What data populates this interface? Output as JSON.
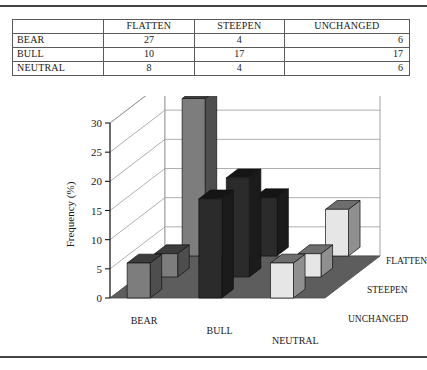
{
  "page": {
    "has_top_rule": true,
    "has_bottom_rule": true
  },
  "table": {
    "corner_label": "",
    "columns": [
      "FLATTEN",
      "STEEPEN",
      "UNCHANGED"
    ],
    "rows": [
      {
        "label": "BEAR",
        "values": [
          27,
          4,
          6
        ]
      },
      {
        "label": "BULL",
        "values": [
          10,
          17,
          17
        ]
      },
      {
        "label": "NEUTRAL",
        "values": [
          8,
          4,
          6
        ]
      }
    ]
  },
  "chart_data": {
    "type": "bar",
    "subtype": "3d-grouped-column",
    "title": "",
    "xlabel": "",
    "ylabel": "Frequency (%)",
    "zlabel": "",
    "ylim": [
      0,
      30
    ],
    "yticks": [
      0,
      5,
      10,
      15,
      20,
      25,
      30
    ],
    "ytick_labels": [
      "0",
      "5",
      "10",
      "15",
      "20",
      "25",
      "30"
    ],
    "grid": true,
    "legend": "none",
    "categories": [
      "BEAR",
      "BULL",
      "NEUTRAL"
    ],
    "depth_categories": [
      "FLATTEN",
      "STEEPEN",
      "UNCHANGED"
    ],
    "series": [
      {
        "name": "FLATTEN",
        "values": [
          27,
          10,
          8
        ]
      },
      {
        "name": "STEEPEN",
        "values": [
          4,
          17,
          4
        ]
      },
      {
        "name": "UNCHANGED",
        "values": [
          6,
          17,
          6
        ]
      }
    ],
    "category_colors": {
      "BEAR": "#7d7d7d",
      "BULL": "#2b2b2b",
      "NEUTRAL": "#e6e6e6"
    },
    "floor_color": "#5d5d5d",
    "wall_color": "#ffffff",
    "gridline_color": "#9a9a9a"
  }
}
